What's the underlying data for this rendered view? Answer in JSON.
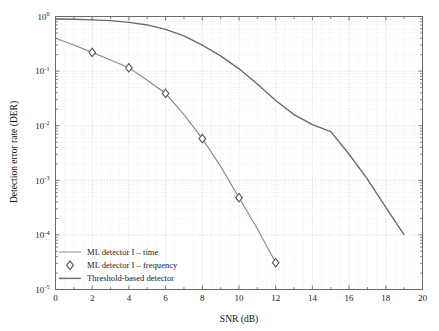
{
  "chart_data": {
    "type": "line",
    "title": "",
    "xlabel": "SNR (dB)",
    "ylabel": "Detection error rate (DER)",
    "xlim": [
      0,
      20
    ],
    "ylim": [
      1e-05,
      1
    ],
    "yscale": "log",
    "grid": true,
    "legend_position": "bottom-left",
    "xticks": [
      0,
      2,
      4,
      6,
      8,
      10,
      12,
      14,
      16,
      18,
      20
    ],
    "yticks": [
      "10^0",
      "10^-1",
      "10^-2",
      "10^-3",
      "10^-4",
      "10^-5"
    ],
    "series": [
      {
        "name": "ML detector I – time",
        "style": "line",
        "x": [
          0,
          1,
          2,
          3,
          4,
          5,
          6,
          7,
          8,
          9,
          10,
          11,
          12
        ],
        "y": [
          0.4,
          0.3,
          0.22,
          0.16,
          0.115,
          0.068,
          0.039,
          0.016,
          0.0058,
          0.0018,
          0.00048,
          0.00013,
          3.1e-05
        ]
      },
      {
        "name": "ML detector I – frequency",
        "style": "marker-diamond",
        "x": [
          2,
          4,
          6,
          8,
          10,
          12
        ],
        "y": [
          0.22,
          0.115,
          0.039,
          0.0058,
          0.00048,
          3.1e-05
        ]
      },
      {
        "name": "Threshold-based detector",
        "style": "line",
        "x": [
          0,
          1,
          2,
          3,
          4,
          5,
          6,
          7,
          8,
          9,
          10,
          11,
          12,
          13,
          14,
          15,
          16,
          17,
          18,
          19
        ],
        "y": [
          0.9,
          0.89,
          0.87,
          0.84,
          0.78,
          0.7,
          0.58,
          0.44,
          0.3,
          0.19,
          0.11,
          0.058,
          0.029,
          0.016,
          0.0105,
          0.0078,
          0.003,
          0.00105,
          0.00032,
          0.0001
        ]
      }
    ]
  },
  "axes": {
    "x_title": "SNR (dB)",
    "y_title": "Detection error rate (DER)",
    "x_tick_labels": [
      "0",
      "2",
      "4",
      "6",
      "8",
      "10",
      "12",
      "14",
      "16",
      "18",
      "20"
    ],
    "y_tick_bases": [
      "10",
      "10",
      "10",
      "10",
      "10",
      "10"
    ],
    "y_tick_exps": [
      "0",
      "-1",
      "-2",
      "-3",
      "-4",
      "-5"
    ]
  },
  "legend": {
    "items": [
      {
        "label": "ML detector I – time",
        "marker": "line-thin",
        "color": "#8a8a8a"
      },
      {
        "label": "ML detector I – frequency",
        "marker": "diamond",
        "color": "#555555"
      },
      {
        "label": "Threshold-based detector",
        "marker": "line-thick",
        "color": "#6a6a6a"
      }
    ]
  },
  "colors": {
    "axis": "#6b6b6b",
    "grid_major": "#c9c9c9",
    "grid_minor": "#e2e2e2",
    "curve_time": "#8a8a8a",
    "curve_threshold": "#6a6a6a",
    "marker_stroke": "#555555",
    "background": "#ffffff"
  }
}
